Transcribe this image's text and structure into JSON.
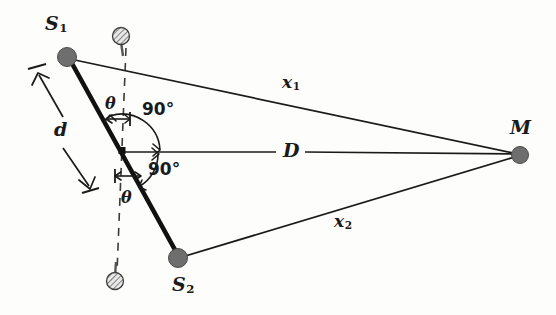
{
  "figure": {
    "background_color": "#fdfdfc",
    "ink_color": "#1a1a1a",
    "source_dot_color": "#6e6e6e",
    "width": 556,
    "height": 315
  },
  "labels": {
    "source1": "S",
    "source1_sub": "1",
    "source2": "S",
    "source2_sub": "2",
    "detector": "M",
    "distance_D": "D",
    "path_x1": "x",
    "path_x1_sub": "1",
    "path_x2": "x",
    "path_x2_sub": "2",
    "separation_d": "d",
    "angle_top": "θ",
    "angle_bottom": "θ",
    "right_angle_top": "90°",
    "right_angle_bottom": "90°"
  },
  "geometry": {
    "source1_point": [
      67,
      57
    ],
    "source2_point": [
      178,
      258
    ],
    "detector_point": [
      520,
      155
    ],
    "center_vertex": [
      122,
      150
    ],
    "dashed_axis_top": [
      126,
      48
    ],
    "dashed_axis_bottom": [
      117,
      272
    ],
    "hatched_ball_top": [
      121,
      36
    ],
    "hatched_ball_bottom": [
      115,
      281
    ],
    "source_dot_radius": 9,
    "detector_dot_radius": 8,
    "hatched_ball_radius": 8
  },
  "annotations": {
    "baseline_label": "d",
    "axis_label": "D",
    "note": "thick baseline S1-S2 crosses horizontal axis D at the center vertex at angle theta from the dashed vertical"
  }
}
